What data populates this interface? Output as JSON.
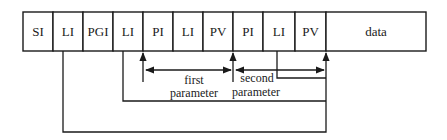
{
  "diagram": {
    "colors": {
      "stroke": "#1a1a1a",
      "background": "#ffffff"
    },
    "fields": [
      {
        "label": "SI",
        "x": 23,
        "w": 30
      },
      {
        "label": "LI",
        "x": 53,
        "w": 30
      },
      {
        "label": "PGI",
        "x": 83,
        "w": 30
      },
      {
        "label": "LI",
        "x": 113,
        "w": 30
      },
      {
        "label": "PI",
        "x": 143,
        "w": 30
      },
      {
        "label": "LI",
        "x": 173,
        "w": 30
      },
      {
        "label": "PV",
        "x": 203,
        "w": 30
      },
      {
        "label": "PI",
        "x": 233,
        "w": 30
      },
      {
        "label": "LI",
        "x": 263,
        "w": 32
      },
      {
        "label": "PV",
        "x": 295,
        "w": 31
      },
      {
        "label": "data",
        "x": 326,
        "w": 100
      }
    ],
    "row": {
      "top": 12,
      "height": 39
    },
    "annotations": {
      "first_line1": "first",
      "first_line2": "parameter",
      "second_line1": "second",
      "second_line2": "parameter"
    }
  }
}
